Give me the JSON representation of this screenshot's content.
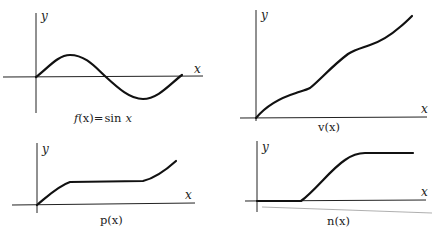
{
  "figure": {
    "panels": [
      {
        "id": "sin",
        "caption_func": "f",
        "caption_arg": "(x)",
        "caption_eq": "=",
        "caption_rhs_fn": "sin",
        "caption_rhs_var": "x",
        "x_label": "x",
        "y_label": "y"
      },
      {
        "id": "v",
        "caption": "v(x)",
        "x_label": "x",
        "y_label": "y"
      },
      {
        "id": "p",
        "caption": "p(x)",
        "x_label": "x",
        "y_label": "y"
      },
      {
        "id": "n",
        "caption": "n(x)",
        "x_label": "x",
        "y_label": "y"
      }
    ]
  }
}
